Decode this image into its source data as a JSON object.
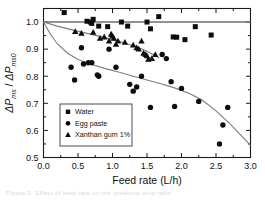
{
  "figure": {
    "background": "#ffffff",
    "caption_partial": "Figure 5.  Effect of feed rate on the pressure drop ratio"
  },
  "chart_data": {
    "type": "scatter",
    "title": "",
    "xlabel": "Feed rate (L/h)",
    "ylabel": "ΔP ms / ΔP ms0",
    "ylabel_parts": {
      "sym1": "ΔP",
      "sub1": "ms",
      "slash": "/ ",
      "sym2": "ΔP",
      "sub2": "ms0"
    },
    "xlim": [
      0.0,
      3.0
    ],
    "ylim": [
      0.5,
      1.05
    ],
    "xticks": [
      0.0,
      0.5,
      1.0,
      1.5,
      2.0,
      2.5,
      3.0
    ],
    "xticklabels": [
      "0.0",
      "0.5",
      "1.0",
      "1.5",
      "2.0",
      "2.5",
      "3.0"
    ],
    "yticks": [
      0.5,
      0.6,
      0.7,
      0.8,
      0.9,
      1.0
    ],
    "yticklabels": [
      "0.5",
      "0.6",
      "0.7",
      "0.8",
      "0.9",
      "1.0"
    ],
    "xminor_count": 1,
    "yminor_count": 1,
    "grid": false,
    "legend_position": "lower-left-inside",
    "colors": {
      "marker": "#0d0d0d",
      "fit_line": "#7d7d7d",
      "reference_line": "#6f6f6f",
      "axis": "#1a1a1a",
      "legend_border": "#3a3a3a"
    },
    "reference_line": {
      "y": 1.0,
      "x_from": 0.0,
      "x_to": 3.0
    },
    "series": [
      {
        "name": "Water",
        "marker": "square",
        "points": [
          [
            0.3,
            1.035
          ],
          [
            0.63,
            1.003
          ],
          [
            0.68,
            1.0
          ],
          [
            0.7,
            0.995
          ],
          [
            0.72,
            1.01
          ],
          [
            0.8,
            0.985
          ],
          [
            0.93,
            0.983
          ],
          [
            1.13,
            1.0
          ],
          [
            1.22,
            0.985
          ],
          [
            1.5,
            1.0
          ],
          [
            1.55,
            0.975
          ],
          [
            1.67,
            1.02
          ],
          [
            1.88,
            0.945
          ],
          [
            1.93,
            0.944
          ],
          [
            2.05,
            0.935
          ],
          [
            2.2,
            0.983
          ],
          [
            2.43,
            0.952
          ]
        ]
      },
      {
        "name": "Egg paste",
        "marker": "circle",
        "points": [
          [
            0.4,
            0.833
          ],
          [
            0.45,
            0.786
          ],
          [
            0.55,
            0.905
          ],
          [
            0.58,
            0.845
          ],
          [
            0.65,
            0.85
          ],
          [
            0.7,
            0.85
          ],
          [
            0.78,
            0.805
          ],
          [
            0.8,
            0.8
          ],
          [
            0.95,
            0.9
          ],
          [
            1.05,
            0.833
          ],
          [
            1.25,
            0.77
          ],
          [
            1.3,
            0.745
          ],
          [
            1.35,
            0.76
          ],
          [
            1.42,
            0.8
          ],
          [
            1.55,
            0.685
          ],
          [
            1.72,
            0.88
          ],
          [
            1.78,
            0.865
          ],
          [
            1.85,
            0.78
          ],
          [
            1.9,
            0.688
          ],
          [
            2.0,
            0.755
          ],
          [
            2.25,
            0.707
          ],
          [
            2.55,
            0.55
          ],
          [
            2.6,
            0.62
          ],
          [
            2.67,
            0.685
          ]
        ]
      },
      {
        "name": "Xanthan gum 1%",
        "marker": "triangle",
        "points": [
          [
            0.46,
            0.965
          ],
          [
            0.55,
            0.958
          ],
          [
            0.72,
            0.962
          ],
          [
            0.82,
            0.94
          ],
          [
            0.88,
            0.945
          ],
          [
            0.95,
            0.93
          ],
          [
            0.98,
            0.955
          ],
          [
            1.0,
            0.948
          ],
          [
            1.02,
            0.94
          ],
          [
            1.05,
            0.918
          ],
          [
            1.08,
            0.93
          ],
          [
            1.18,
            0.925
          ],
          [
            1.3,
            0.915
          ],
          [
            1.35,
            0.905
          ],
          [
            1.38,
            0.9
          ],
          [
            1.42,
            0.93
          ],
          [
            1.45,
            0.885
          ],
          [
            1.48,
            0.88
          ],
          [
            1.5,
            0.875
          ],
          [
            1.52,
            0.862
          ],
          [
            1.57,
            0.865
          ],
          [
            1.62,
            0.88
          ]
        ]
      }
    ],
    "fit_curves": [
      {
        "name": "egg-paste-fit",
        "points": [
          [
            0.0,
            1.0
          ],
          [
            0.1,
            0.955
          ],
          [
            0.2,
            0.92
          ],
          [
            0.35,
            0.885
          ],
          [
            0.5,
            0.862
          ],
          [
            0.7,
            0.843
          ],
          [
            0.9,
            0.828
          ],
          [
            1.1,
            0.815
          ],
          [
            1.3,
            0.8
          ],
          [
            1.5,
            0.786
          ],
          [
            1.7,
            0.772
          ],
          [
            1.9,
            0.757
          ],
          [
            2.1,
            0.738
          ],
          [
            2.3,
            0.712
          ],
          [
            2.5,
            0.672
          ],
          [
            2.7,
            0.625
          ],
          [
            2.85,
            0.585
          ],
          [
            3.0,
            0.545
          ]
        ]
      },
      {
        "name": "xanthan-gum-fit",
        "points": [
          [
            0.0,
            1.0
          ],
          [
            0.2,
            0.985
          ],
          [
            0.4,
            0.972
          ],
          [
            0.6,
            0.96
          ],
          [
            0.8,
            0.948
          ],
          [
            1.0,
            0.935
          ],
          [
            1.2,
            0.921
          ],
          [
            1.4,
            0.903
          ],
          [
            1.5,
            0.892
          ],
          [
            1.6,
            0.878
          ],
          [
            1.68,
            0.866
          ]
        ]
      }
    ],
    "legend": {
      "entries": [
        {
          "label": "Water",
          "marker": "square"
        },
        {
          "label": "Egg paste",
          "marker": "circle"
        },
        {
          "label": "Xanthan gum 1%",
          "marker": "triangle"
        }
      ]
    }
  }
}
